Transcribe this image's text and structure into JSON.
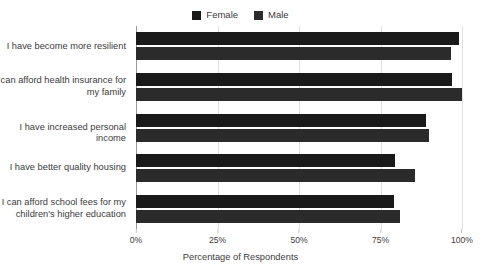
{
  "chart_data": {
    "type": "bar",
    "orientation": "horizontal",
    "title": "",
    "xlabel": "Percentage of Respondents",
    "ylabel": "",
    "xlim": [
      0,
      100
    ],
    "xticks": [
      "0%",
      "25%",
      "50%",
      "75%",
      "100%"
    ],
    "xtick_values": [
      0,
      25,
      50,
      75,
      100
    ],
    "grid": true,
    "legend_position": "top-center",
    "categories": [
      "I have become more resilient",
      "I can afford health insurance for\nmy family",
      "I have increased personal income",
      "I have better quality housing",
      "I can afford school fees for my\nchildren's higher education"
    ],
    "series": [
      {
        "name": "Female",
        "color": "#1a1a1a",
        "values": [
          99,
          97,
          89,
          79.5,
          79
        ]
      },
      {
        "name": "Male",
        "color": "#2b2b2b",
        "values": [
          96.5,
          100,
          90,
          85.5,
          81
        ]
      }
    ]
  },
  "legend": {
    "items": [
      {
        "label": "Female",
        "color": "#1a1a1a"
      },
      {
        "label": "Male",
        "color": "#2b2b2b"
      }
    ]
  },
  "axis": {
    "x_title": "Percentage of Respondents"
  },
  "colors": {
    "background": "#ffffff",
    "gridline": "#e2e2e2",
    "axis_line": "#9a9a9a",
    "text": "#3b3b3b"
  }
}
